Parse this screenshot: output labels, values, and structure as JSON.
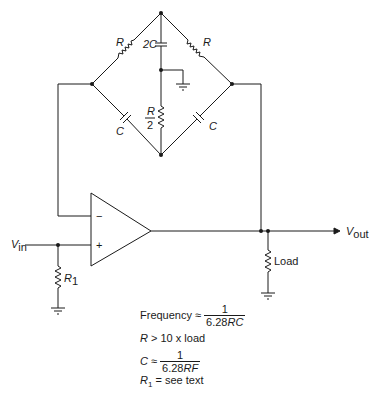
{
  "diagram": {
    "type": "twin-T / bridge oscillator circuit schematic",
    "components": {
      "r_top_left": "R",
      "r_top_right": "R",
      "c_center_top": "2C",
      "r_center_num": "R",
      "r_center_den": "2",
      "c_bottom_left": "C",
      "c_bottom_right": "C",
      "r1": "R",
      "r1_sub": "1",
      "load": "Load",
      "opamp_inverting": "−",
      "opamp_noninverting": "+"
    },
    "signals": {
      "vin": "V",
      "vin_sub": "in",
      "vout": "V",
      "vout_sub": "out"
    },
    "notes": {
      "frequency_label": "Frequency ≈",
      "frequency_num": "1",
      "frequency_den_num": "6.28",
      "frequency_den_var": "RC",
      "r_condition_var": "R",
      "r_condition": " > 10 x load",
      "c_var": "C",
      "c_approx": " ≈",
      "c_num": "1",
      "c_den_num": "6.28",
      "c_den_var": "RF",
      "r1_var": "R",
      "r1_sub": "1",
      "r1_note": " = see text"
    }
  }
}
